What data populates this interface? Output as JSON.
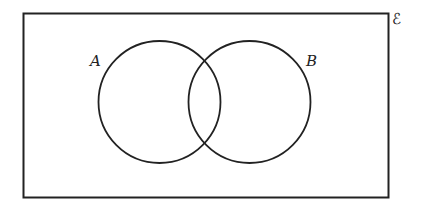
{
  "diagram": {
    "type": "venn",
    "universal_set": {
      "symbol": "ℰ",
      "rect": {
        "x": 23,
        "y": 13,
        "w": 365,
        "h": 184
      }
    },
    "sets": [
      {
        "label": "A",
        "cx": 159.5,
        "cy": 102,
        "r": 61,
        "label_x": 90,
        "label_y": 66
      },
      {
        "label": "B",
        "cx": 249.5,
        "cy": 102,
        "r": 61,
        "label_x": 306,
        "label_y": 66
      }
    ],
    "colors": {
      "stroke": "#222222",
      "background": "#ffffff"
    }
  }
}
